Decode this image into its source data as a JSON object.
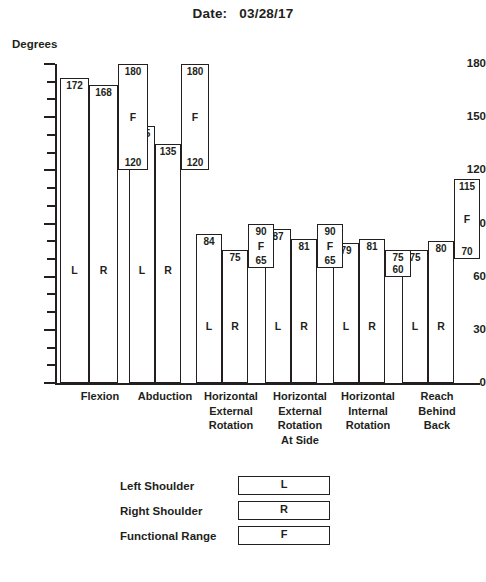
{
  "header": {
    "date_label": "Date:",
    "date_value": "03/28/17"
  },
  "axis": {
    "y_title": "Degrees",
    "y_ticks_major": [
      "180",
      "150",
      "120",
      "90",
      "60",
      "30",
      "0"
    ]
  },
  "legend": {
    "rows": [
      {
        "label": "Left Shoulder",
        "key": "L"
      },
      {
        "label": "Right Shoulder",
        "key": "R"
      },
      {
        "label": "Functional Range",
        "key": "F"
      }
    ]
  },
  "chart_data": {
    "type": "bar",
    "xlabel": "",
    "ylabel": "Degrees",
    "ylim": [
      0,
      180
    ],
    "ytick_step_major": 30,
    "ytick_step_minor": 10,
    "grid": false,
    "legend_position": "bottom",
    "categories": [
      "Flexion",
      "Abduction",
      "Horizontal External Rotation",
      "Horizontal External Rotation At Side",
      "Horizontal Internal Rotation",
      "Reach Behind Back"
    ],
    "category_lines": [
      [
        "Flexion"
      ],
      [
        "Abduction"
      ],
      [
        "Horizontal",
        "External",
        "Rotation"
      ],
      [
        "Horizontal",
        "External",
        "Rotation",
        "At Side"
      ],
      [
        "Horizontal",
        "Internal",
        "Rotation"
      ],
      [
        "Reach",
        "Behind",
        "Back"
      ]
    ],
    "series": [
      {
        "name": "Left Shoulder",
        "key": "L",
        "values": [
          172,
          145,
          84,
          87,
          79,
          75
        ]
      },
      {
        "name": "Right Shoulder",
        "key": "R",
        "values": [
          168,
          135,
          75,
          81,
          81,
          80
        ]
      }
    ],
    "functional_range": {
      "name": "Functional Range",
      "key": "F",
      "min": [
        120,
        120,
        65,
        65,
        60,
        70
      ],
      "max": [
        180,
        180,
        90,
        90,
        75,
        115
      ]
    }
  },
  "groups": [
    {
      "name": "Flexion",
      "lines": [
        "Flexion"
      ],
      "left": {
        "key": "L",
        "value": "172"
      },
      "right": {
        "key": "R",
        "value": "168"
      },
      "func": {
        "key": "F",
        "min": "120",
        "max": "180"
      }
    },
    {
      "name": "Abduction",
      "lines": [
        "Abduction"
      ],
      "left": {
        "key": "L",
        "value": "145"
      },
      "right": {
        "key": "R",
        "value": "135"
      },
      "func": {
        "key": "F",
        "min": "120",
        "max": "180"
      }
    },
    {
      "name": "Horizontal External Rotation",
      "lines": [
        "Horizontal",
        "External",
        "Rotation"
      ],
      "left": {
        "key": "L",
        "value": "84"
      },
      "right": {
        "key": "R",
        "value": "75"
      },
      "func": {
        "key": "F",
        "min": "65",
        "max": "90"
      }
    },
    {
      "name": "Horizontal External Rotation At Side",
      "lines": [
        "Horizontal",
        "External",
        "Rotation",
        "At Side"
      ],
      "left": {
        "key": "L",
        "value": "87"
      },
      "right": {
        "key": "R",
        "value": "81"
      },
      "func": {
        "key": "F",
        "min": "65",
        "max": "90"
      }
    },
    {
      "name": "Horizontal Internal Rotation",
      "lines": [
        "Horizontal",
        "Internal",
        "Rotation"
      ],
      "left": {
        "key": "L",
        "value": "79"
      },
      "right": {
        "key": "R",
        "value": "81"
      },
      "func": {
        "key": "",
        "min": "60",
        "max": "75"
      }
    },
    {
      "name": "Reach Behind Back",
      "lines": [
        "Reach",
        "Behind",
        "Back"
      ],
      "left": {
        "key": "L",
        "value": "75"
      },
      "right": {
        "key": "R",
        "value": "80"
      },
      "func": {
        "key": "F",
        "min": "70",
        "max": "115"
      }
    }
  ],
  "colors": {
    "ink": "#231f20",
    "background": "#ffffff"
  }
}
